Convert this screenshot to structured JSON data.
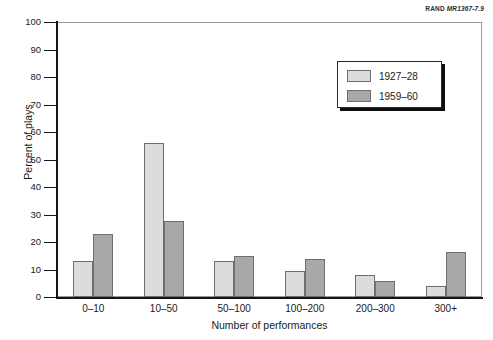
{
  "figure_tag": {
    "brand": "RAND",
    "id": "MR1367-7.9"
  },
  "chart_data": {
    "type": "bar",
    "title": "",
    "xlabel": "Number of performances",
    "ylabel": "Percent of plays",
    "categories": [
      "0–10",
      "10–50",
      "50–100",
      "100–200",
      "200–300",
      "300+"
    ],
    "series": [
      {
        "name": "1927–28",
        "color": "#dcdcdc",
        "values": [
          13,
          56,
          13,
          9.5,
          8,
          4
        ]
      },
      {
        "name": "1959–60",
        "color": "#a8a8a8",
        "values": [
          23,
          27.5,
          15,
          14,
          6,
          16.5
        ]
      }
    ],
    "ylim": [
      0,
      100
    ],
    "yticks": [
      0,
      10,
      20,
      30,
      40,
      50,
      60,
      70,
      80,
      90,
      100
    ],
    "ytick_labels": [
      "0",
      "10",
      "20",
      "30",
      "40",
      "50",
      "60",
      "70",
      "80",
      "90",
      "100"
    ],
    "grid": false,
    "legend_position": "upper-right"
  }
}
